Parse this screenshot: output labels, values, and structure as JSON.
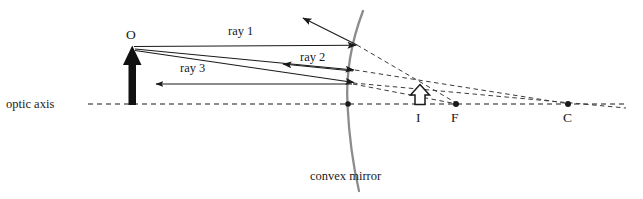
{
  "figure": {
    "type": "ray-diagram",
    "background_color": "#ffffff",
    "line_color": "#1a1a1a",
    "mirror_color": "#8c8c8c",
    "width": 643,
    "height": 199
  },
  "labels": {
    "optic_axis": "optic axis",
    "object_point": "O",
    "ray1": "ray 1",
    "ray2": "ray 2",
    "ray3": "ray 3",
    "image_point": "I",
    "focal_point": "F",
    "center_point": "C",
    "mirror": "convex mirror"
  },
  "geometry": {
    "optic_axis_y": 104,
    "optic_axis_x_start": 88,
    "optic_axis_x_end": 626,
    "object_x": 132,
    "object_tip_y": 48,
    "mirror_vertex": [
      348,
      104
    ],
    "image_x": 420,
    "image_tip_y": 85,
    "focal_point_x": 456,
    "center_point_x": 568,
    "ray1_hit": [
      357,
      45
    ],
    "ray1_reflect_end": [
      303,
      18
    ],
    "ray2_hit": [
      355,
      70
    ],
    "ray2_reflect_end": [
      285,
      63
    ],
    "ray3_hit": [
      355,
      82
    ],
    "ray3_reflect_end": [
      158,
      84
    ]
  },
  "label_positions": {
    "optic_axis": [
      6,
      97
    ],
    "object_point": [
      126,
      27
    ],
    "ray1": [
      228,
      24
    ],
    "ray2": [
      300,
      50
    ],
    "ray3": [
      180,
      61
    ],
    "image_point": [
      416,
      110
    ],
    "focal_point": [
      451,
      110
    ],
    "center_point": [
      563,
      110
    ],
    "mirror": [
      310,
      169
    ]
  }
}
